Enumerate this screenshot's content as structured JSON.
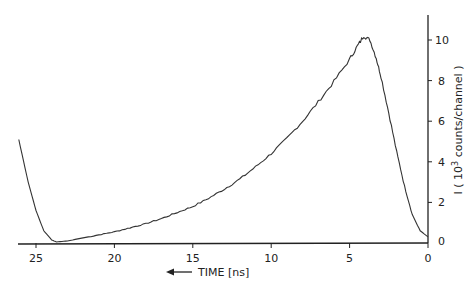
{
  "chart_data": {
    "type": "line",
    "title": "",
    "xlabel": "TIME [ns]",
    "xlabel_arrow": "left",
    "ylabel": "I (10^3 counts/channel)",
    "y_axis_position": "right",
    "x_reversed": true,
    "xlim": [
      26.2,
      0
    ],
    "ylim": [
      0,
      11
    ],
    "grid": false,
    "legend": null,
    "x_ticks": [
      25,
      20,
      15,
      10,
      5,
      0
    ],
    "y_ticks": [
      0,
      2,
      4,
      6,
      8,
      10
    ],
    "series": [
      {
        "name": "fluorescence intensity",
        "x": [
          26.1,
          25.5,
          25.0,
          24.5,
          24.0,
          23.7,
          23.0,
          22.0,
          21.0,
          20.0,
          19.0,
          18.0,
          17.0,
          16.0,
          15.0,
          14.0,
          13.0,
          12.0,
          11.0,
          10.0,
          9.0,
          8.0,
          7.0,
          6.0,
          5.0,
          4.5,
          4.1,
          3.7,
          3.3,
          3.0,
          2.5,
          2.0,
          1.5,
          1.0,
          0.5,
          0.0
        ],
        "values": [
          5.1,
          3.0,
          1.6,
          0.6,
          0.15,
          0.05,
          0.1,
          0.25,
          0.4,
          0.55,
          0.75,
          0.95,
          1.2,
          1.5,
          1.8,
          2.2,
          2.65,
          3.15,
          3.75,
          4.4,
          5.15,
          6.0,
          6.95,
          7.95,
          9.05,
          9.7,
          10.2,
          10.0,
          9.1,
          8.2,
          6.4,
          4.5,
          2.8,
          1.4,
          0.6,
          0.3
        ]
      }
    ]
  },
  "labels": {
    "x_title": "TIME [ns]",
    "y_title_main": "I ( 10",
    "y_title_sup": "3",
    "y_title_rest": " counts/channel )",
    "x_ticks": [
      "25",
      "20",
      "15",
      "10",
      "5",
      "0"
    ],
    "y_ticks": [
      "0",
      "2",
      "4",
      "6",
      "8",
      "10"
    ]
  }
}
